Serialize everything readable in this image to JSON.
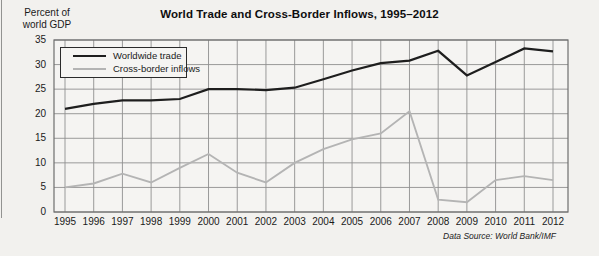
{
  "chart_data": {
    "type": "line",
    "title": "World Trade and Cross-Border Inflows, 1995–2012",
    "ylabel": "Percent of world GDP",
    "ylabel_lines": [
      "Percent of",
      "world GDP"
    ],
    "source": "Data Source: World Bank/IMF",
    "categories": [
      "1995",
      "1996",
      "1997",
      "1998",
      "1999",
      "2000",
      "2001",
      "2002",
      "2003",
      "2004",
      "2005",
      "2006",
      "2007",
      "2008",
      "2009",
      "2010",
      "2011",
      "2012"
    ],
    "series": [
      {
        "name": "Worldwide trade",
        "color": "#1e1e1e",
        "line_width": 2.2,
        "values": [
          21,
          22,
          22.7,
          22.7,
          23,
          25,
          25,
          24.8,
          25.3,
          27,
          28.8,
          30.3,
          30.8,
          32.8,
          27.8,
          30.5,
          33.3,
          32.7
        ]
      },
      {
        "name": "Cross-border inflows",
        "color": "#b4b4b4",
        "line_width": 1.9,
        "values": [
          5,
          5.8,
          7.8,
          6,
          9,
          11.8,
          8,
          6,
          10,
          12.8,
          14.8,
          16,
          20.5,
          2.5,
          2,
          6.5,
          7.3,
          6.5
        ]
      }
    ],
    "ylim": [
      0,
      35
    ],
    "yticks": [
      0,
      5,
      10,
      15,
      20,
      25,
      30,
      35
    ],
    "grid": "on",
    "legend_position": "top-left-inside",
    "colors": {
      "grid": "#909090",
      "plot_border": "#6e6e6e",
      "page_background": "#f2f1ee",
      "plot_background": "#f5f4f2",
      "text": "#1a1a1a"
    }
  }
}
